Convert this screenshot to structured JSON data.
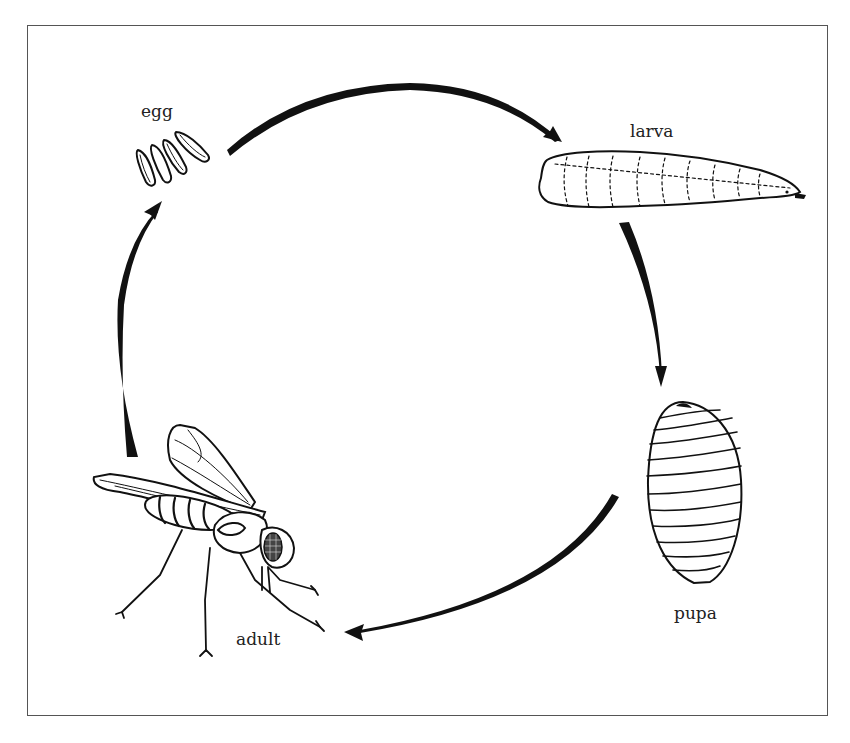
{
  "figure": {
    "type": "life-cycle",
    "title": "",
    "colors": {
      "ink": "#111111",
      "frame": "#555555",
      "background": "#ffffff"
    },
    "stages": [
      {
        "id": "egg",
        "label": "egg"
      },
      {
        "id": "larva",
        "label": "larva"
      },
      {
        "id": "pupa",
        "label": "pupa"
      },
      {
        "id": "adult",
        "label": "adult"
      }
    ],
    "transitions": [
      {
        "from": "egg",
        "to": "larva"
      },
      {
        "from": "larva",
        "to": "pupa"
      },
      {
        "from": "pupa",
        "to": "adult"
      },
      {
        "from": "adult",
        "to": "egg"
      }
    ]
  }
}
